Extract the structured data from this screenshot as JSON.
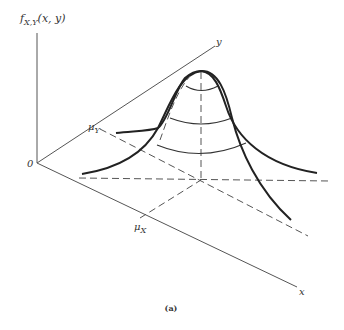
{
  "figure": {
    "function_label": "f",
    "function_subscript": "X,Y",
    "function_args": "(x, y)",
    "origin_label": "0",
    "x_axis_label": "x",
    "y_axis_label": "y",
    "mu_x_label": "μ",
    "mu_x_sub": "X",
    "mu_y_label": "μ",
    "mu_y_sub": "Y",
    "caption": "(a)"
  },
  "colors": {
    "axis": "#555555",
    "curve": "#222222",
    "background": "#ffffff"
  }
}
